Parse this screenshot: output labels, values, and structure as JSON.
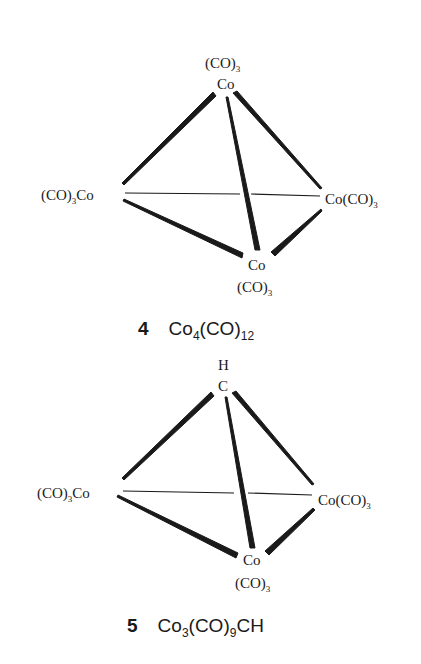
{
  "structures": [
    {
      "number": "4",
      "formula": {
        "a": "Co",
        "a_sub": "4",
        "b": "(CO)",
        "b_sub": "12",
        "c": ""
      },
      "apex": {
        "top_label": "(CO)",
        "top_sub": "3",
        "label": "Co"
      },
      "left": {
        "pre": "(CO)",
        "pre_sub": "3",
        "atom": "Co"
      },
      "right": {
        "atom": "Co",
        "post": "(CO)",
        "post_sub": "3"
      },
      "bottom": {
        "label": "Co",
        "ligand": "(CO)",
        "ligand_sub": "3"
      }
    },
    {
      "number": "5",
      "formula": {
        "a": "Co",
        "a_sub": "3",
        "b": "(CO)",
        "b_sub": "9",
        "c": "CH"
      },
      "apex": {
        "top_label": "H",
        "top_sub": "",
        "label": "C"
      },
      "left": {
        "pre": "(CO)",
        "pre_sub": "3",
        "atom": "Co"
      },
      "right": {
        "atom": "Co",
        "post": "(CO)",
        "post_sub": "3"
      },
      "bottom": {
        "label": "Co",
        "ligand": "(CO)",
        "ligand_sub": "3"
      }
    }
  ],
  "colors": {
    "ink": "#1a1a1a",
    "background": "#ffffff"
  }
}
